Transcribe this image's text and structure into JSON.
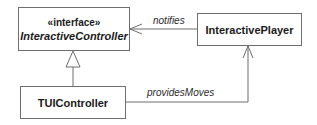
{
  "diagram": {
    "type": "uml-class-diagram",
    "colors": {
      "line": "#6e6e6e",
      "text": "#1a1a1a",
      "background": "#ffffff"
    },
    "classes": [
      {
        "id": "interactive-controller",
        "stereotype": "«interface»",
        "name": "InteractiveController",
        "abstract": true
      },
      {
        "id": "interactive-player",
        "name": "InteractivePlayer"
      },
      {
        "id": "tui-controller",
        "name": "TUIController"
      }
    ],
    "relationships": [
      {
        "from": "InteractivePlayer",
        "to": "InteractiveController",
        "kind": "association",
        "label": "notifies",
        "arrow": "open"
      },
      {
        "from": "TUIController",
        "to": "InteractiveController",
        "kind": "realization",
        "label": "",
        "arrow": "hollow-triangle"
      },
      {
        "from": "TUIController",
        "to": "InteractivePlayer",
        "kind": "association",
        "label": "providesMoves",
        "arrow": "open"
      }
    ]
  }
}
